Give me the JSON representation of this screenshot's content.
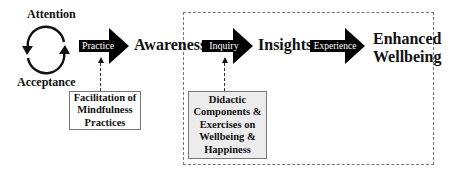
{
  "diagram": {
    "cycle": {
      "top_label": "Attention",
      "bottom_label": "Acceptance",
      "icon": "circular-arrows-icon"
    },
    "arrows": [
      {
        "label": "Practice"
      },
      {
        "label": "Inquiry"
      },
      {
        "label": "Experience"
      }
    ],
    "stages": {
      "awareness": "Awareness",
      "insights": "Insights",
      "outcome_line1": "Enhanced",
      "outcome_line2": "Wellbeing"
    },
    "notes": {
      "facilitation": [
        "Facilitation of",
        "Mindfulness",
        "Practices"
      ],
      "didactic": [
        "Didactic",
        "Components &",
        "Exercises on",
        "Wellbeing &",
        "Happiness"
      ]
    },
    "colors": {
      "arrow_fill": "#000000",
      "note_gray_fill": "#ececec",
      "dashed_border": "#777777"
    }
  }
}
